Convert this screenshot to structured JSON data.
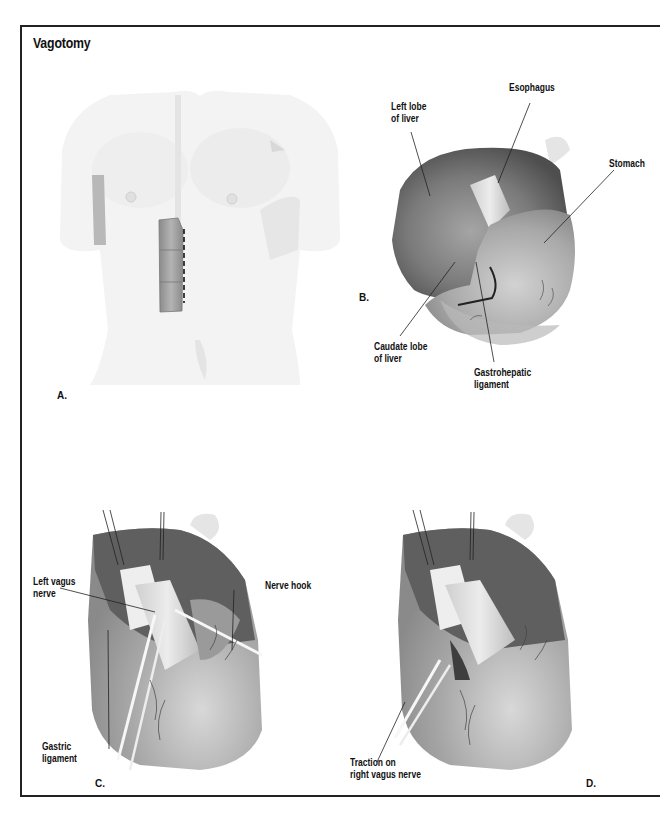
{
  "figure": {
    "title": "Vagotomy",
    "frame_color": "#222222",
    "palette": {
      "skin_light": "#f2f2f2",
      "skin_mid": "#e2e2e2",
      "muscle": "#9a9a9a",
      "liver_dark": "#5e5e5e",
      "liver_mid": "#8a8a8a",
      "stomach": "#a9a9a9",
      "esophagus": "#d8d8d8",
      "instrument": "#f5f5f5"
    }
  },
  "panels": {
    "a": {
      "letter": "A.",
      "incision": "dashed upper midline incision"
    },
    "b": {
      "letter": "B.",
      "labels": {
        "left_lobe_line1": "Left lobe",
        "left_lobe_line2": "of liver",
        "esophagus": "Esophagus",
        "stomach": "Stomach",
        "caudate_line1": "Caudate lobe",
        "caudate_line2": "of liver",
        "gastrohepatic_line1": "Gastrohepatic",
        "gastrohepatic_line2": "ligament"
      }
    },
    "c": {
      "letter": "C.",
      "labels": {
        "left_vagus_line1": "Left vagus",
        "left_vagus_line2": "nerve",
        "nerve_hook": "Nerve hook",
        "gastric_line1": "Gastric",
        "gastric_line2": "ligament"
      }
    },
    "d": {
      "letter": "D.",
      "labels": {
        "traction_line1": "Traction on",
        "traction_line2": "right vagus nerve"
      }
    }
  }
}
